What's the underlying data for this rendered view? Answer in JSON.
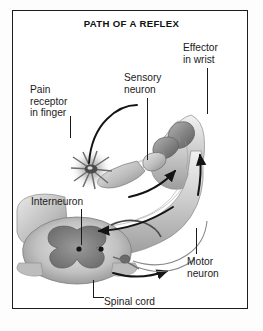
{
  "figure": {
    "title": "PATH OF A REFLEX",
    "kind": "anatomical-illustration",
    "style": "grayscale halftone line art",
    "frame_color": "#1d1d1d",
    "background_color": "#ffffff",
    "ink_color": "#1b1b1b"
  },
  "labels": {
    "pain_receptor": "Pain\nreceptor\nin finger",
    "sensory_neuron": "Sensory\nneuron",
    "effector": "Effector\nin wrist",
    "interneuron": "Interneuron",
    "motor_neuron": "Motor\nneuron",
    "spinal_cord": "Spinal cord"
  },
  "structures": [
    {
      "name": "pain-receptor-in-finger",
      "note": "starburst flash at fingertip"
    },
    {
      "name": "hand-and-wrist",
      "note": "hand drawn recoiling with motion lines"
    },
    {
      "name": "forearm",
      "note": "forearm carrying nerve pathways"
    },
    {
      "name": "sensory-neuron-pathway",
      "note": "nerve from finger to spinal cord"
    },
    {
      "name": "motor-neuron-pathway",
      "note": "nerve from spinal cord to wrist muscle"
    },
    {
      "name": "spinal-cord-cross-section",
      "note": "butterfly-shaped gray matter"
    },
    {
      "name": "interneuron",
      "note": "connector neuron inside gray matter"
    }
  ],
  "arrows": [
    {
      "name": "arrow-sensory-inbound",
      "direction": "toward spinal cord"
    },
    {
      "name": "arrow-motor-outbound",
      "direction": "toward wrist"
    },
    {
      "name": "arrow-wrist-up",
      "direction": "upward along forearm"
    }
  ]
}
